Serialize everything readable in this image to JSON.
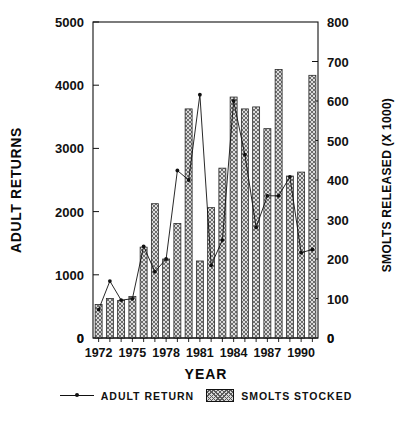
{
  "chart_data": {
    "type": "bar",
    "title": "",
    "xlabel": "YEAR",
    "ylabel": "ADULT RETURNS",
    "ylabel_right": "SMOLTS RELEASED (X 1000)",
    "ylim": [
      0,
      5000
    ],
    "ylim_right": [
      0,
      800
    ],
    "yticks": [
      0,
      1000,
      2000,
      3000,
      4000,
      5000
    ],
    "yticks_right": [
      0,
      100,
      200,
      300,
      400,
      500,
      600,
      700,
      800
    ],
    "grid": false,
    "legend_position": "below",
    "categories": [
      1972,
      1973,
      1974,
      1975,
      1976,
      1977,
      1978,
      1979,
      1980,
      1981,
      1982,
      1983,
      1984,
      1985,
      1986,
      1987,
      1988,
      1989,
      1990,
      1991
    ],
    "xtick_labels": [
      "1972",
      "1975",
      "1978",
      "1981",
      "1984",
      "1987",
      "1990"
    ],
    "xtick_years": [
      1972,
      1975,
      1978,
      1981,
      1984,
      1987,
      1990
    ],
    "series": [
      {
        "name": "SMOLTS STOCKED",
        "type": "bar",
        "axis": "right",
        "units": "thousands",
        "values": [
          85,
          100,
          95,
          105,
          230,
          340,
          200,
          290,
          580,
          195,
          330,
          430,
          610,
          580,
          585,
          530,
          680,
          410,
          420,
          665
        ]
      },
      {
        "name": "ADULT RETURN",
        "type": "line",
        "axis": "left",
        "units": "returns",
        "values": [
          450,
          900,
          600,
          620,
          1450,
          1050,
          1250,
          2650,
          2500,
          3850,
          1150,
          1550,
          3750,
          2900,
          1750,
          2250,
          2250,
          2550,
          1350,
          1400
        ]
      }
    ]
  },
  "legend": {
    "line_label": "ADULT RETURN",
    "bar_label": "SMOLTS STOCKED"
  },
  "axis_titles": {
    "left": "ADULT RETURNS",
    "right": "SMOLTS RELEASED (X 1000)",
    "bottom": "YEAR"
  },
  "colors": {
    "axis": "#111111",
    "bar_fill": "#d8d8d8",
    "bar_hatch": "#5a5a5a",
    "line": "#111111",
    "background": "#ffffff"
  }
}
